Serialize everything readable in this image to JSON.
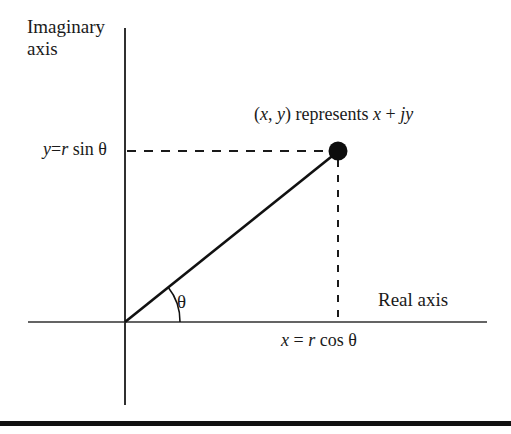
{
  "figure": {
    "background_color": "#ffffff",
    "ink_color": "#1a1a1a",
    "width": 511,
    "height": 434
  },
  "labels": {
    "imaginary_axis": "Imaginary axis",
    "real_axis": "Real axis",
    "theta": "θ",
    "y_expression_plain": "y=r sin θ",
    "x_expression_plain": "x = r cos θ",
    "point_expression_plain": "(x, y) represents x + jy"
  },
  "y_expression_parts": {
    "var": "y",
    "equals": "=",
    "radius": "r",
    "func": " sin ",
    "angle": "θ"
  },
  "x_expression_parts": {
    "var": "x",
    "equals": " = ",
    "radius": "r",
    "func": " cos ",
    "angle": "θ"
  },
  "point_expression_parts": {
    "open": "(",
    "x": "x",
    "comma": ", ",
    "y": "y",
    "close": ") ",
    "verb": "represents ",
    "real": "x",
    "plus": " + ",
    "imag_unit": "j",
    "imag_var": "y"
  },
  "geometry": {
    "origin": {
      "x": 125,
      "y": 322
    },
    "point": {
      "x": 338,
      "y": 151
    },
    "point_dot_radius": 9,
    "vertical_axis": {
      "x": 125,
      "y_top": 28,
      "y_bottom": 405
    },
    "horizontal_axis": {
      "y": 322,
      "x_left": 28,
      "x_right": 487
    },
    "dashed_horizontal": {
      "y": 151,
      "x_start": 127,
      "x_end": 330
    },
    "dashed_vertical": {
      "x": 338,
      "y_start": 161,
      "y_end": 322
    },
    "angle_arc_radius": 55,
    "angle_degrees": 38.8,
    "bottom_rule": {
      "y": 421,
      "height": 5,
      "color": "#111111"
    }
  }
}
